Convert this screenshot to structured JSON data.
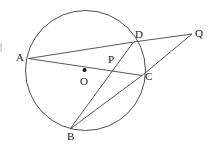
{
  "figure": {
    "type": "circle-geometry-diagram",
    "width": 213,
    "height": 149,
    "background_color": "#ffffff",
    "stroke_color": "#3a3a3a",
    "label_color": "#1a1a1a",
    "stroke_width": 0.9
  },
  "circle": {
    "name": "circle-O",
    "center": {
      "x": 85.5,
      "y": 70.5
    },
    "radius": 60
  },
  "points": [
    {
      "id": "A",
      "label": "A",
      "x": 28.5,
      "y": 58.5,
      "label_x": 16,
      "label_y": 52,
      "on_circle": true
    },
    {
      "id": "D",
      "label": "D",
      "x": 133.5,
      "y": 42.0,
      "label_x": 135,
      "label_y": 29,
      "on_circle": true
    },
    {
      "id": "C",
      "label": "C",
      "x": 142.0,
      "y": 75.5,
      "label_x": 145,
      "label_y": 71,
      "on_circle": true
    },
    {
      "id": "B",
      "label": "B",
      "x": 70.0,
      "y": 129.0,
      "label_x": 67,
      "label_y": 131,
      "on_circle": true
    },
    {
      "id": "Q",
      "label": "Q",
      "x": 192.0,
      "y": 34.0,
      "label_x": 195,
      "label_y": 28,
      "on_circle": false
    },
    {
      "id": "P",
      "label": "P",
      "x": 110.0,
      "y": 68.0,
      "label_x": 108,
      "label_y": 54,
      "on_circle": false
    },
    {
      "id": "O",
      "label": "O",
      "x": 84.5,
      "y": 70.0,
      "label_x": 80,
      "label_y": 76,
      "on_circle": false
    }
  ],
  "center_dot": {
    "name": "center-point-O",
    "x": 84.5,
    "y": 70.0,
    "radius": 2.0
  },
  "segments": [
    {
      "name": "segment-A-D",
      "from": "A",
      "to": "D",
      "x1": 28.5,
      "y1": 58.5,
      "x2": 133.5,
      "y2": 42.0
    },
    {
      "name": "segment-D-Q",
      "from": "D",
      "to": "Q",
      "x1": 133.5,
      "y1": 42.0,
      "x2": 192.0,
      "y2": 34.0
    },
    {
      "name": "segment-A-C",
      "from": "A",
      "to": "C",
      "x1": 28.5,
      "y1": 58.5,
      "x2": 142.0,
      "y2": 75.5
    },
    {
      "name": "segment-C-Q",
      "from": "C",
      "to": "Q",
      "x1": 142.0,
      "y1": 75.5,
      "x2": 192.0,
      "y2": 34.0
    },
    {
      "name": "segment-B-D",
      "from": "B",
      "to": "D",
      "x1": 70.0,
      "y1": 129.0,
      "x2": 133.5,
      "y2": 42.0
    },
    {
      "name": "segment-B-C",
      "from": "B",
      "to": "C",
      "x1": 70.0,
      "y1": 129.0,
      "x2": 142.0,
      "y2": 75.5
    }
  ],
  "artifacts": {
    "left_edge_mark": "|"
  }
}
